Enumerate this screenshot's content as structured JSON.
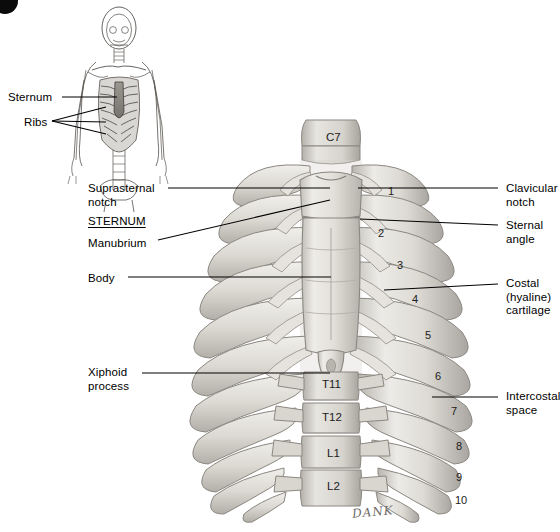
{
  "figure": {
    "badge": "",
    "signature": "DANK"
  },
  "inset": {
    "name": "body-orientation-inset",
    "labels": [
      {
        "text": "Sternum",
        "x": 8,
        "y": 91
      },
      {
        "text": "Ribs",
        "x": 24,
        "y": 116
      }
    ]
  },
  "main": {
    "left_labels": [
      {
        "name": "suprasternal-notch",
        "text": "Suprasternal\nnotch",
        "x": 88,
        "y": 182,
        "heading": false
      },
      {
        "name": "sternum",
        "text": "STERNUM",
        "x": 88,
        "y": 215,
        "heading": true
      },
      {
        "name": "manubrium",
        "text": "Manubrium",
        "x": 88,
        "y": 237,
        "heading": false
      },
      {
        "name": "body",
        "text": "Body",
        "x": 88,
        "y": 272,
        "heading": false
      },
      {
        "name": "xiphoid-process",
        "text": "Xiphoid\nprocess",
        "x": 88,
        "y": 366,
        "heading": false
      }
    ],
    "right_labels": [
      {
        "name": "clavicular-notch",
        "text": "Clavicular\nnotch",
        "x": 506,
        "y": 182
      },
      {
        "name": "sternal-angle",
        "text": "Sternal\nangle",
        "x": 506,
        "y": 219
      },
      {
        "name": "costal-cartilage",
        "text": "Costal\n(hyaline)\ncartilage",
        "x": 506,
        "y": 277
      },
      {
        "name": "intercostal-space",
        "text": "Intercostal\nspace",
        "x": 506,
        "y": 390
      }
    ],
    "rib_numbers": [
      {
        "text": "1",
        "x": 388,
        "y": 186
      },
      {
        "text": "2",
        "x": 378,
        "y": 228
      },
      {
        "text": "3",
        "x": 397,
        "y": 260
      },
      {
        "text": "4",
        "x": 412,
        "y": 294
      },
      {
        "text": "5",
        "x": 425,
        "y": 330
      },
      {
        "text": "6",
        "x": 435,
        "y": 371
      },
      {
        "text": "7",
        "x": 451,
        "y": 406
      },
      {
        "text": "8",
        "x": 456,
        "y": 441
      },
      {
        "text": "9",
        "x": 456,
        "y": 472
      },
      {
        "text": "10",
        "x": 455,
        "y": 495
      }
    ],
    "vertebra_labels": [
      {
        "text": "C7",
        "x": 326,
        "y": 132
      },
      {
        "text": "T11",
        "x": 322,
        "y": 379
      },
      {
        "text": "T12",
        "x": 322,
        "y": 412
      },
      {
        "text": "L1",
        "x": 327,
        "y": 448
      },
      {
        "text": "L2",
        "x": 327,
        "y": 481
      }
    ]
  },
  "colors": {
    "background": "#ffffff",
    "bone_light": "#e9e6e1",
    "bone_mid": "#cfccc6",
    "bone_shadow": "#a8a49e",
    "bone_dark": "#8d8983",
    "outline": "#6b6762",
    "text": "#000000",
    "leader_line": "#000000",
    "inset_line": "#55514d",
    "cartilage": "#dedbd6"
  }
}
